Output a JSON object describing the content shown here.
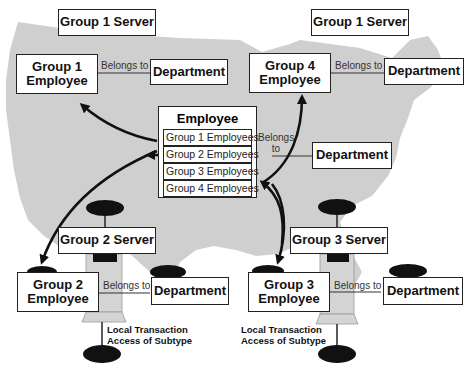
{
  "diagram": {
    "title": "",
    "servers": [
      {
        "label": "Group 1 Server"
      },
      {
        "label": "Group 1 Server"
      },
      {
        "label": "Group 2 Server"
      },
      {
        "label": "Group 3 Server"
      }
    ],
    "employees": [
      {
        "label_line1": "Group 1",
        "label_line2": "Employee"
      },
      {
        "label_line1": "Group 4",
        "label_line2": "Employee"
      },
      {
        "label_line1": "Group 2",
        "label_line2": "Employee"
      },
      {
        "label_line1": "Group 3",
        "label_line2": "Employee"
      }
    ],
    "departments": [
      {
        "label": "Department"
      },
      {
        "label": "Department"
      },
      {
        "label": "Department"
      },
      {
        "label": "Department"
      },
      {
        "label": "Department"
      }
    ],
    "relation": {
      "belongs_to": "Belongs to",
      "belongs_to_split_line1": "Belongs",
      "belongs_to_split_line2": "to"
    },
    "central_employee": {
      "title": "Employee",
      "subtypes": [
        "Group 1 Employees",
        "Group 2 Employees",
        "Group 3 Employees",
        "Group 4 Employees"
      ]
    },
    "notes": [
      {
        "line1": "Local Transaction",
        "line2": "Access of Subtype"
      },
      {
        "line1": "Local Transaction",
        "line2": "Access of Subtype"
      }
    ],
    "colors": {
      "map_fill": "#cfcfcf",
      "box_border": "#222222",
      "arrow": "#111111",
      "cylinder": "#cccccc"
    }
  }
}
